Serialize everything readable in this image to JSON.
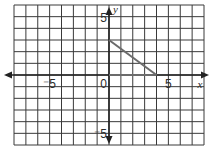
{
  "chart_data": {
    "type": "line",
    "title": "",
    "xlabel": "x",
    "ylabel": "y",
    "xlim": [
      -8,
      8
    ],
    "ylim": [
      -6,
      6
    ],
    "grid": true,
    "grid_step": 1,
    "x_tick_labels": [
      {
        "value": -5,
        "label": "⁻5"
      },
      {
        "value": 0,
        "label": "0"
      },
      {
        "value": 5,
        "label": "5"
      }
    ],
    "y_tick_labels": [
      {
        "value": 5,
        "label": "5"
      },
      {
        "value": -5,
        "label": "⁻5"
      }
    ],
    "series": [
      {
        "name": "triangle",
        "points": [
          [
            0,
            3
          ],
          [
            4,
            0
          ]
        ],
        "vertices": [
          [
            0,
            0
          ],
          [
            0,
            3
          ],
          [
            4,
            0
          ]
        ],
        "color": "#6b6b6b"
      }
    ]
  },
  "labels": {
    "x_axis": "x",
    "y_axis": "y",
    "origin": "0",
    "x_pos5": "5",
    "x_neg5": "⁻5",
    "y_pos5": "5",
    "y_neg5": "⁻5"
  },
  "colors": {
    "grid": "#3a3a3a",
    "axis": "#222222",
    "line": "#6b6b6b",
    "background": "#ffffff"
  }
}
